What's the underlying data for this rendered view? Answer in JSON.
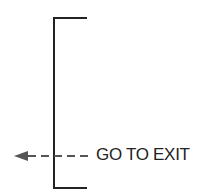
{
  "diagram": {
    "connector_label": "GO TO EXIT",
    "line_color": "#222222",
    "arrow_color": "#555555",
    "icons": {
      "arrow": "arrow-left-dashed",
      "bracket": "left-bracket"
    }
  }
}
